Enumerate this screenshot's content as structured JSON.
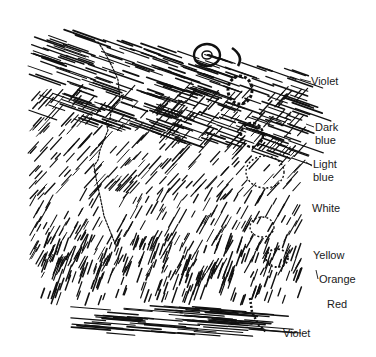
{
  "figure": {
    "type": "pen-and-ink hatched illustration of banded color field around a human profile",
    "ink_color": "#111111",
    "background_color": "#ffffff",
    "labels": [
      {
        "id": "violet-top",
        "lines": [
          "Violet"
        ],
        "x": 311,
        "y": 75
      },
      {
        "id": "dark-blue",
        "lines": [
          "Dark",
          "blue"
        ],
        "x": 314,
        "y": 121
      },
      {
        "id": "light-blue",
        "lines": [
          "Light",
          "blue"
        ],
        "x": 313,
        "y": 158
      },
      {
        "id": "white",
        "lines": [
          "White"
        ],
        "x": 312,
        "y": 202
      },
      {
        "id": "yellow",
        "lines": [
          "Yellow"
        ],
        "x": 313,
        "y": 249
      },
      {
        "id": "orange",
        "lines": [
          "Orange"
        ],
        "x": 318,
        "y": 273
      },
      {
        "id": "red",
        "lines": [
          "Red"
        ],
        "x": 327,
        "y": 298
      },
      {
        "id": "violet-bottom",
        "lines": [
          "Violet"
        ],
        "x": 283,
        "y": 327
      }
    ]
  },
  "labels": {
    "violet_top": "Violet",
    "dark_blue_1": "Dark",
    "dark_blue_2": "blue",
    "light_blue_1": "Light",
    "light_blue_2": "blue",
    "white": "White",
    "yellow": "Yellow",
    "orange": "Orange",
    "red": "Red",
    "violet_bottom": "Violet"
  }
}
